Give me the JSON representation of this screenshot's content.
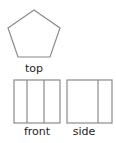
{
  "diagram": {
    "stroke_color": "#8a8a8a",
    "views": [
      {
        "name": "top",
        "label": "top",
        "shape": "pentagon",
        "points": [
          [
            34,
            10
          ],
          [
            60,
            28
          ],
          [
            50,
            57
          ],
          [
            18,
            57
          ],
          [
            8,
            28
          ]
        ],
        "label_pos": [
          34,
          63
        ]
      },
      {
        "name": "front",
        "label": "front",
        "shape": "rectangle",
        "rect": [
          14,
          80,
          46,
          43
        ],
        "divider_x": [
          27,
          44
        ],
        "label_pos": [
          37,
          127
        ]
      },
      {
        "name": "side",
        "label": "side",
        "shape": "rectangle",
        "rect": [
          67,
          80,
          45,
          43
        ],
        "divider_x": [
          98
        ],
        "label_pos": [
          84,
          127
        ]
      }
    ]
  }
}
